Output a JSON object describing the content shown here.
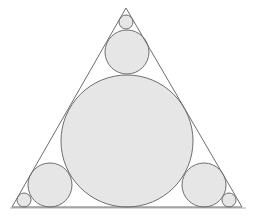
{
  "diagram": {
    "type": "geometric-figure",
    "colors": {
      "background": "#ffffff",
      "stroke": "#6e6e6e",
      "circle_fill": "#e6e6e6",
      "baseline": "#9a9a9a"
    },
    "triangle": {
      "points": [
        [
          126,
          8
        ],
        [
          12,
          207
        ],
        [
          242,
          207
        ]
      ]
    },
    "circles": [
      {
        "name": "incircle",
        "cx": 127,
        "cy": 141,
        "r": 66
      },
      {
        "name": "top-medium-circle",
        "cx": 127,
        "cy": 52,
        "r": 22
      },
      {
        "name": "top-small-circle",
        "cx": 126,
        "cy": 22,
        "r": 7
      },
      {
        "name": "left-medium-circle",
        "cx": 50,
        "cy": 185,
        "r": 22
      },
      {
        "name": "left-small-circle",
        "cx": 24,
        "cy": 200,
        "r": 7
      },
      {
        "name": "right-medium-circle",
        "cx": 204,
        "cy": 185,
        "r": 22
      },
      {
        "name": "right-small-circle",
        "cx": 229,
        "cy": 200,
        "r": 7
      }
    ]
  }
}
